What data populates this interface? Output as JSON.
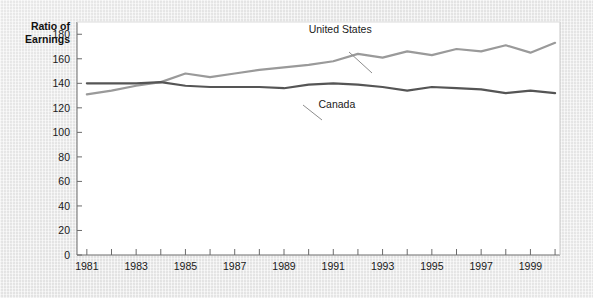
{
  "chart_data": {
    "type": "line",
    "title": "",
    "ylabel_line1": "Ratio of",
    "ylabel_line2": "Earnings",
    "xlabel": "",
    "ylim": [
      0,
      190
    ],
    "xlim": [
      1980.6,
      2000.2
    ],
    "grid": false,
    "legend_position": "inline-annotations",
    "yticks": [
      0,
      20,
      40,
      60,
      80,
      100,
      120,
      140,
      160,
      180
    ],
    "ytick_labels": [
      "0",
      "20",
      "40",
      "60",
      "80",
      "100",
      "120",
      "140",
      "160",
      "180"
    ],
    "xticks": [
      1981,
      1982,
      1983,
      1984,
      1985,
      1986,
      1987,
      1988,
      1989,
      1990,
      1991,
      1992,
      1993,
      1994,
      1995,
      1996,
      1997,
      1998,
      1999,
      2000
    ],
    "xtick_labels": [
      "1981",
      "",
      "1983",
      "",
      "1985",
      "",
      "1987",
      "",
      "1989",
      "",
      "1991",
      "",
      "1993",
      "",
      "1995",
      "",
      "1997",
      "",
      "1999",
      ""
    ],
    "x": [
      1981,
      1982,
      1983,
      1984,
      1985,
      1986,
      1987,
      1988,
      1989,
      1990,
      1991,
      1992,
      1993,
      1994,
      1995,
      1996,
      1997,
      1998,
      1999,
      2000
    ],
    "series": [
      {
        "name": "United States",
        "color": "#9a9a9a",
        "values": [
          131,
          134,
          138,
          141,
          148,
          145,
          148,
          151,
          153,
          155,
          158,
          164,
          161,
          166,
          163,
          168,
          166,
          171,
          165,
          173
        ]
      },
      {
        "name": "Canada",
        "color": "#555555",
        "values": [
          140,
          140,
          140,
          141,
          138,
          137,
          137,
          137,
          136,
          139,
          140,
          139,
          137,
          134,
          137,
          136,
          135,
          132,
          134,
          132
        ]
      }
    ],
    "annotations": [
      {
        "text": "United States",
        "x": 1990.0,
        "y": 181
      },
      {
        "text": "Canada",
        "x": 1990.4,
        "y": 120
      }
    ]
  }
}
